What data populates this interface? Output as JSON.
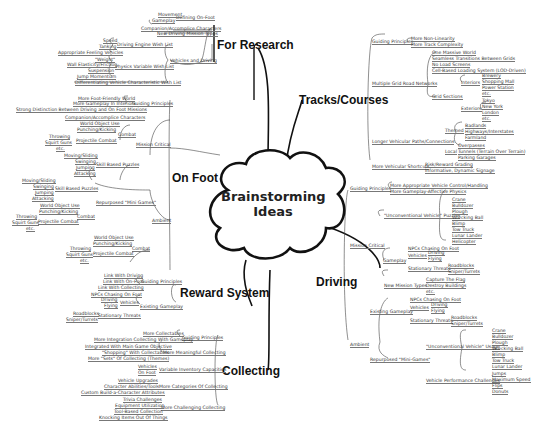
{
  "center": {
    "line1": "Brainstorming",
    "line2": "Ideas"
  },
  "branches": {
    "research": "For Research",
    "tracks": "Tracks/Courses",
    "onfoot": "On Foot",
    "driving": "Driving",
    "reward": "Reward System",
    "collecting": "Collecting"
  },
  "research": {
    "defining": "Defining On-Foot",
    "movement": "Movement",
    "gameplay": "Gameplay",
    "companion": "Companion/Accomplice Characters",
    "newdriving": "New Driving Mission Types",
    "vehicles": "Vehicles and Driving",
    "engine": "Driving Engine Wish List",
    "speed": "Speed",
    "tanking": "Tanking",
    "appropriate": "Appropriate Feeling Vehicles",
    "physics": "Physics Variable Wish List",
    "weight": "\"Weight\"",
    "wall": "Wall Elasticity/Friction",
    "suspension": "Suspension",
    "jump": "Jump Momentum",
    "differentiating": "Differentiating Vehicle Characteristic Wish List"
  },
  "onfoot": {
    "guiding": "Guiding Principles",
    "g1": "More Foot-Friendly World",
    "g2": "More Gameplay In Interiors",
    "g3": "Strong Distinction Between Driving and On Foot Missions",
    "mission": "Mission Critical",
    "m_companion": "Companion/Accomplice Characters",
    "m_combat": "Combat",
    "m_world": "World Object Use",
    "m_punch": "Punching/Kicking",
    "m_proj": "Projectile Combat",
    "m_throw": "Throwing",
    "m_squirt": "Squirt Guns",
    "m_etc": "etc.",
    "m_skill": "Skill Based Puzzles",
    "m_moving": "Moving/Sliding",
    "m_swinging": "Swinging",
    "m_jumping": "Jumping",
    "m_attacking": "Attacking",
    "ambient": "Ambient",
    "a_repurposed": "Repurposed \"Mini Games\"",
    "a_skill": "Skill Based Puzzles",
    "a_moving": "Moving/Sliding",
    "a_swinging": "Swinging",
    "a_jumping": "Jumping",
    "a_attacking": "Attacking",
    "a_combat": "Combat",
    "a_world": "World Object Use",
    "a_punch": "Punching/Kicking",
    "a_proj": "Projectile Combat",
    "a_throw": "Throwing",
    "a_squirt": "Squirt Guns",
    "a_etc": "etc.",
    "b_combat": "Combat",
    "b_world": "World Object Use",
    "b_punch": "Punching/Kicking",
    "b_proj": "Projectile Combat",
    "b_throw": "Throwing",
    "b_squirt": "Squirt Guns",
    "b_etc": "etc."
  },
  "reward": {
    "guiding": "Guiding Principles",
    "r1": "Link With Driving",
    "r2": "Link With On-Foot",
    "r3": "Link With Collecting",
    "existing": "Existing Gameplay",
    "npcs": "NPCs Chasing On Foot",
    "vehicles": "Vehicles",
    "driving": "Driving",
    "flying": "Flying",
    "stationary": "Stationary Threats",
    "roadblocks": "Roadblocks",
    "snipers": "Sniper/Turrets"
  },
  "collecting": {
    "guiding": "Guiding Principles",
    "c1": "More Collectables",
    "c2": "More Integration Collecting With Gameplay",
    "meaningful": "More Meaningful Collecting",
    "m1": "Integrated With Main Game Objective",
    "m2": "\"Shopping\" With Collectables",
    "m3": "More \"Sets\" Of Collecting (Themes)",
    "inventory": "Variable Inventory Capacities",
    "i1": "Vehicles",
    "i2": "On Foot",
    "categories": "More Categories Of Collecting",
    "k1": "Vehicle Upgrades",
    "k2": "Character Abilities/Tools",
    "k3": "Custom Build-a-Character Attributes",
    "challenging": "More Challenging Collecting",
    "h1": "Trivia Challenges",
    "h2": "Equipment Utilization",
    "h3": "Tool-Based Collection",
    "h4": "Knocking Items Out Of Things"
  },
  "tracks": {
    "guiding": "Guiding Principles",
    "g1": "More Non-Linearity",
    "g2": "More Track Complexity",
    "multiple": "Multiple Grid Road Networks",
    "mp1": "One Massive World",
    "mp2": "Seamless Transitions Between Grids",
    "mp3": "No Load Screens",
    "mp4": "Cell-Based Loading System (LOD-Driven)",
    "grid": "Grid Sections",
    "interiors": "Interiors",
    "in1": "Brewery",
    "in2": "Shopping Mall",
    "in3": "Power Station",
    "in4": "etc.",
    "exteriors": "Exteriors",
    "ex1": "Tokyo",
    "ex2": "New York",
    "ex3": "London",
    "ex4": "etc.",
    "longer": "Longer Vehicular Paths/Connections",
    "themed": "Themed",
    "th1": "Badlands",
    "th2": "Highways/Interstates",
    "th3": "Farmland",
    "local": "Local",
    "lo1": "Overpasses",
    "lo2": "Tunnels (Terrain Over Terrain)",
    "lo3": "Parking Garages",
    "shortcuts": "More Vehicular Shortcuts",
    "sh1": "Risk/Reward Grading",
    "sh2": "Informative, Dynamic Signage"
  },
  "driving": {
    "guiding": "Guiding Principles",
    "g1": "More Appropriate Vehicle Control/Handling",
    "g2": "More Gameplay-Affective Physics",
    "mission": "Mission Critical",
    "puzzles": "\"Unconventional Vehicle\" Puzzles",
    "pz": [
      "Crane",
      "Bulldozer",
      "Plough",
      "Wrecking Ball",
      "Blimp",
      "Tow Truck",
      "Lunar Lander",
      "Helicopter"
    ],
    "gameplay": "Gameplay",
    "npcs": "NPCs Chasing On Foot",
    "vehicles": "Vehicles",
    "driving": "Driving",
    "flying": "Flying",
    "stationary": "Stationary Threats",
    "roadblocks": "Roadblocks",
    "snipers": "Sniper/Turrets",
    "newtypes": "New Mission Types",
    "nt1": "Capture The Flag",
    "nt2": "Destroy Buildings",
    "nt3": "etc.",
    "ambient": "Ambient",
    "existing": "Existing Gameplay",
    "e_npcs": "NPCs Chasing On Foot",
    "e_vehicles": "Vehicles",
    "e_driving": "Driving",
    "e_flying": "Flying",
    "e_stationary": "Stationary Threats",
    "e_roadblocks": "Roadblocks",
    "e_snipers": "Sniper/Turrets",
    "repurposed": "Repurposed \"Mini-Games\"",
    "usage": "\"Unconventional Vehicle\" Usage",
    "us": [
      "Crane",
      "Bulldozer",
      "Plough",
      "Wrecking Ball",
      "Blimp",
      "Tow Truck",
      "Lunar Lander"
    ],
    "performance": "Vehicle Performance Challenges",
    "pf": [
      "Jumps",
      "Maximum Speed",
      "Flips",
      "Donuts"
    ]
  }
}
